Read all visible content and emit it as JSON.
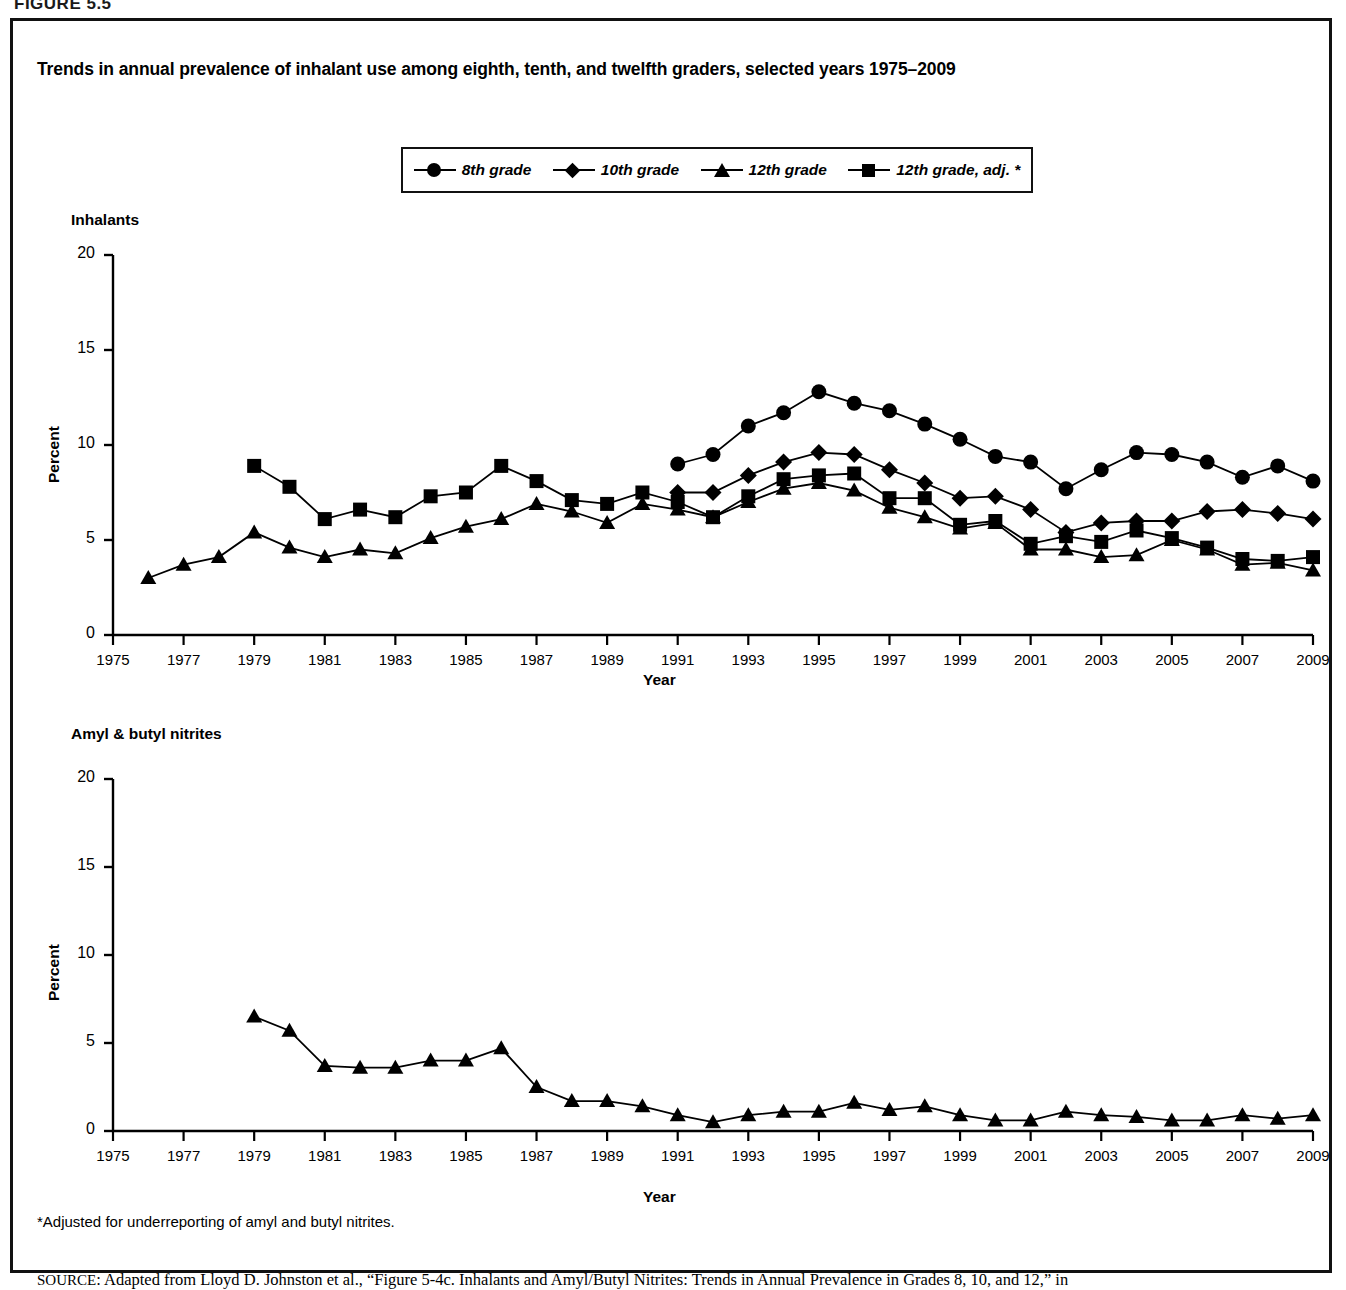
{
  "figure": {
    "label": "FIGURE 5.5",
    "title": "Trends in annual prevalence of inhalant use among eighth, tenth, and twelfth graders, selected years 1975–2009",
    "footnote": "*Adjusted for underreporting of amyl and butyl nitrites.",
    "source_prefix": "SOURCE",
    "source_text": ": Adapted from Lloyd D. Johnston et al., “Figure 5-4c. Inhalants and Amyl/Butyl Nitrites: Trends in Annual Prevalence in Grades 8, 10, and 12,” in"
  },
  "legend": {
    "position": "top-center",
    "items": [
      {
        "label": "8th grade",
        "marker": "circle"
      },
      {
        "label": "10th grade",
        "marker": "diamond"
      },
      {
        "label": "12th grade",
        "marker": "triangle"
      },
      {
        "label": "12th grade, adj. *",
        "marker": "square"
      }
    ]
  },
  "chart_data": [
    {
      "type": "line",
      "title": "Inhalants",
      "xlabel": "Year",
      "ylabel": "Percent",
      "ylim": [
        0,
        20
      ],
      "yticks": [
        0,
        5,
        10,
        15,
        20
      ],
      "xlim": [
        1975,
        2009
      ],
      "xticks": [
        1975,
        1977,
        1979,
        1981,
        1983,
        1985,
        1987,
        1989,
        1991,
        1993,
        1995,
        1997,
        1999,
        2001,
        2003,
        2005,
        2007,
        2009
      ],
      "grid": false,
      "legend": "top-center",
      "series": [
        {
          "name": "8th grade",
          "marker": "circle",
          "x": [
            1991,
            1992,
            1993,
            1994,
            1995,
            1996,
            1997,
            1998,
            1999,
            2000,
            2001,
            2002,
            2003,
            2004,
            2005,
            2006,
            2007,
            2008,
            2009
          ],
          "values": [
            9.0,
            9.5,
            11.0,
            11.7,
            12.8,
            12.2,
            11.8,
            11.1,
            10.3,
            9.4,
            9.1,
            7.7,
            8.7,
            9.6,
            9.5,
            9.1,
            8.3,
            8.9,
            8.1
          ]
        },
        {
          "name": "10th grade",
          "marker": "diamond",
          "x": [
            1991,
            1992,
            1993,
            1994,
            1995,
            1996,
            1997,
            1998,
            1999,
            2000,
            2001,
            2002,
            2003,
            2004,
            2005,
            2006,
            2007,
            2008,
            2009
          ],
          "values": [
            7.5,
            7.5,
            8.4,
            9.1,
            9.6,
            9.5,
            8.7,
            8.0,
            7.2,
            7.3,
            6.6,
            5.4,
            5.9,
            6.0,
            6.0,
            6.5,
            6.6,
            6.4,
            6.1
          ]
        },
        {
          "name": "12th grade",
          "marker": "triangle",
          "x": [
            1976,
            1977,
            1978,
            1979,
            1980,
            1981,
            1982,
            1983,
            1984,
            1985,
            1986,
            1987,
            1988,
            1989,
            1990,
            1991,
            1992,
            1993,
            1994,
            1995,
            1996,
            1997,
            1998,
            1999,
            2000,
            2001,
            2002,
            2003,
            2004,
            2005,
            2006,
            2007,
            2008,
            2009
          ],
          "values": [
            3.0,
            3.7,
            4.1,
            5.4,
            4.6,
            4.1,
            4.5,
            4.3,
            5.1,
            5.7,
            6.1,
            6.9,
            6.5,
            5.9,
            6.9,
            6.6,
            6.2,
            7.0,
            7.7,
            8.0,
            7.6,
            6.7,
            6.2,
            5.6,
            5.9,
            4.5,
            4.5,
            4.1,
            4.2,
            5.0,
            4.5,
            3.7,
            3.8,
            3.4
          ]
        },
        {
          "name": "12th grade, adj.",
          "marker": "square",
          "x": [
            1979,
            1980,
            1981,
            1982,
            1983,
            1984,
            1985,
            1986,
            1987,
            1988,
            1989,
            1990,
            1991,
            1992,
            1993,
            1994,
            1995,
            1996,
            1997,
            1998,
            1999,
            2000,
            2001,
            2002,
            2003,
            2004,
            2005,
            2006,
            2007,
            2008,
            2009
          ],
          "values": [
            8.9,
            7.8,
            6.1,
            6.6,
            6.2,
            7.3,
            7.5,
            8.9,
            8.1,
            7.1,
            6.9,
            7.5,
            7.0,
            6.2,
            7.3,
            8.2,
            8.4,
            8.5,
            7.2,
            7.2,
            5.8,
            6.0,
            4.8,
            5.2,
            4.9,
            5.5,
            5.1,
            4.6,
            4.0,
            3.9,
            4.1
          ]
        }
      ]
    },
    {
      "type": "line",
      "title": "Amyl & butyl nitrites",
      "xlabel": "Year",
      "ylabel": "Percent",
      "ylim": [
        0,
        20
      ],
      "yticks": [
        0,
        5,
        10,
        15,
        20
      ],
      "xlim": [
        1975,
        2009
      ],
      "xticks": [
        1975,
        1977,
        1979,
        1981,
        1983,
        1985,
        1987,
        1989,
        1991,
        1993,
        1995,
        1997,
        1999,
        2001,
        2003,
        2005,
        2007,
        2009
      ],
      "grid": false,
      "series": [
        {
          "name": "12th grade",
          "marker": "triangle",
          "x": [
            1979,
            1980,
            1981,
            1982,
            1983,
            1984,
            1985,
            1986,
            1987,
            1988,
            1989,
            1990,
            1991,
            1992,
            1993,
            1994,
            1995,
            1996,
            1997,
            1998,
            1999,
            2000,
            2001,
            2002,
            2003,
            2004,
            2005,
            2006,
            2007,
            2008,
            2009
          ],
          "values": [
            6.5,
            5.7,
            3.7,
            3.6,
            3.6,
            4.0,
            4.0,
            4.7,
            2.5,
            1.7,
            1.7,
            1.4,
            0.9,
            0.5,
            0.9,
            1.1,
            1.1,
            1.6,
            1.2,
            1.4,
            0.9,
            0.6,
            0.6,
            1.1,
            0.9,
            0.8,
            0.6,
            0.6,
            0.9,
            0.7,
            0.9
          ]
        }
      ]
    }
  ]
}
